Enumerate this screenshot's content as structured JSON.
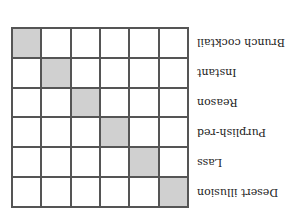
{
  "orientation": "rotated-180",
  "matrix": {
    "rows": 6,
    "cols": 6,
    "filled_color": "#d0d0d0",
    "line_color": "#555555",
    "labels": [
      "Desert illusion",
      "Lass",
      "Purplish-red",
      "Reason",
      "Instant",
      "Brunch cocktail"
    ],
    "filled_cells": [
      [
        0,
        0
      ],
      [
        1,
        1
      ],
      [
        2,
        2
      ],
      [
        3,
        3
      ],
      [
        4,
        4
      ],
      [
        5,
        5
      ]
    ]
  }
}
